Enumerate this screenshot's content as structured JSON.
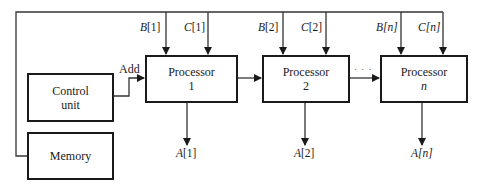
{
  "diagram": {
    "control_unit": {
      "line1": "Control",
      "line2": "unit"
    },
    "memory": {
      "label": "Memory"
    },
    "add_signal": "Add",
    "ellipsis": "· · ·",
    "processors": [
      {
        "title": "Processor",
        "index": "1",
        "input_b": "B",
        "input_b_idx": "[1]",
        "input_c": "C",
        "input_c_idx": "[1]",
        "output_a": "A",
        "output_a_idx": "[1]"
      },
      {
        "title": "Processor",
        "index": "2",
        "input_b": "B",
        "input_b_idx": "[2]",
        "input_c": "C",
        "input_c_idx": "[2]",
        "output_a": "A",
        "output_a_idx": "[2]"
      },
      {
        "title": "Processor",
        "index": "n",
        "input_b": "B",
        "input_b_idx": "[n]",
        "input_c": "C",
        "input_c_idx": "[n]",
        "output_a": "A",
        "output_a_idx": "[n]"
      }
    ]
  }
}
